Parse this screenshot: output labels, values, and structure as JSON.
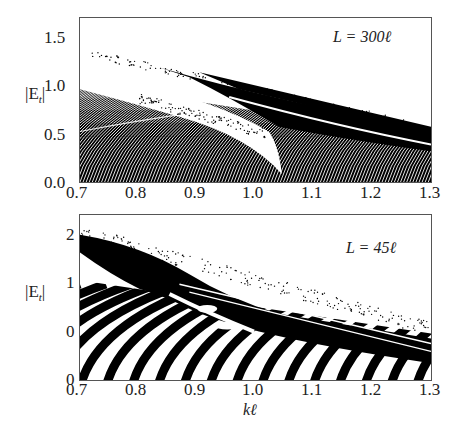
{
  "chart_data": [
    {
      "type": "scatter",
      "panel": "top",
      "title": "",
      "annotation": "L = 300ℓ",
      "xlabel": "",
      "ylabel": "|E_t|",
      "xlim": [
        0.7,
        1.3
      ],
      "ylim": [
        0.0,
        1.7
      ],
      "xticks": [
        "0.7",
        "0.8",
        "0.9",
        "1.0",
        "1.1",
        "1.2",
        "1.3"
      ],
      "yticks": [
        "0.0",
        "0.5",
        "1.0",
        "1.5"
      ],
      "grid": false,
      "description": "Dense band structure of |E_t| vs kℓ; lower region filled with fine curved fringes (0 to ~1.0 at kℓ=0.7 decreasing to ~0.35 at 1.3); white gap wedge closing at kℓ≈1.07; upper dark band from ~1.3 at 0.8 to ~0.5 at 1.3 with scattered points"
    },
    {
      "type": "scatter",
      "panel": "bottom",
      "title": "",
      "annotation": "L = 45ℓ",
      "xlabel": "kℓ",
      "ylabel": "|E_t|",
      "xlim": [
        0.7,
        1.3
      ],
      "ylim": [
        -1.0,
        2.4
      ],
      "xticks": [
        "0.7",
        "0.8",
        "0.9",
        "1.0",
        "1.1",
        "1.2",
        "1.3"
      ],
      "yticks": [
        "0",
        "0",
        "1",
        "2"
      ],
      "grid": false,
      "description": "Coarse alternating black/white curved fringes; upper dense band from ~2.2 at 0.7 down to ~0.6 at 1.3 with scattered points above"
    }
  ],
  "labels": {
    "top": {
      "ylabel": "|E",
      "ysub": "t",
      "yclose": "|",
      "annotation": "L = 300ℓ",
      "yticks": [
        "1.5",
        "1.0",
        "0.5",
        "0.0"
      ],
      "xticks": [
        "0.7",
        "0.8",
        "0.9",
        "1.0",
        "1.1",
        "1.2",
        "1.3"
      ]
    },
    "bottom": {
      "ylabel": "|E",
      "ysub": "t",
      "yclose": "|",
      "annotation": "L = 45ℓ",
      "yticks": [
        "2",
        "1",
        "0",
        "0"
      ],
      "xticks": [
        "0.7",
        "0.8",
        "0.9",
        "1.0",
        "1.1",
        "1.2",
        "1.3"
      ],
      "xlabel": "kℓ"
    }
  }
}
